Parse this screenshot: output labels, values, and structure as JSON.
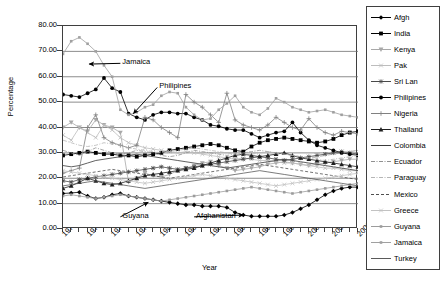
{
  "chart_data": {
    "type": "line",
    "title": "",
    "xlabel": "Year",
    "ylabel": "Percentage",
    "grid": "horizontal",
    "legend_position": "right",
    "xlim": [
      1970,
      2006
    ],
    "ylim": [
      0,
      80
    ],
    "ytick_step": 10,
    "ytick_labels": [
      "0.00",
      "10.00",
      "20.00",
      "30.00",
      "40.00",
      "50.00",
      "60.00",
      "70.00",
      "80.00"
    ],
    "ytick_values": [
      0,
      10,
      20,
      30,
      40,
      50,
      60,
      70,
      80
    ],
    "xtick_labels": [
      "1970",
      "1973",
      "1976",
      "1979",
      "1982",
      "1985",
      "1988",
      "1991",
      "1994",
      "1997",
      "2000",
      "2003",
      "2006"
    ],
    "xtick_values": [
      1970,
      1973,
      1976,
      1979,
      1982,
      1985,
      1988,
      1991,
      1994,
      1997,
      2000,
      2003,
      2006
    ],
    "x": [
      1970,
      1971,
      1972,
      1973,
      1974,
      1975,
      1976,
      1977,
      1978,
      1979,
      1980,
      1981,
      1982,
      1983,
      1984,
      1985,
      1986,
      1987,
      1988,
      1989,
      1990,
      1991,
      1992,
      1993,
      1994,
      1995,
      1996,
      1997,
      1998,
      1999,
      2000,
      2001,
      2002,
      2003,
      2004,
      2005,
      2006
    ],
    "annotations": [
      {
        "text": "Jamaica",
        "x": 1977.0,
        "y": 64.5,
        "arrow_to_x": 1973.2,
        "arrow_to_y": 65.0
      },
      {
        "text": "Philipines",
        "x": 1981.5,
        "y": 55.0,
        "arrow_to_x": 1978.6,
        "arrow_to_y": 45.5
      },
      {
        "text": "Guyana",
        "x": 1977.0,
        "y": 4.0,
        "arrow_to_x": 1980.4,
        "arrow_to_y": 10.5
      },
      {
        "text": "Afghanistan",
        "x": 1986.0,
        "y": 4.0,
        "arrow_to_x": 1992.0,
        "arrow_to_y": 5.5
      }
    ],
    "series": [
      {
        "name": "Afgh",
        "color": "#000000",
        "marker": "diamond",
        "dash": "none",
        "values": [
          14.0,
          14.2,
          14.5,
          13.0,
          12.0,
          12.5,
          13.5,
          14.0,
          13.0,
          12.5,
          12.0,
          11.5,
          11.0,
          10.5,
          10.0,
          9.5,
          9.5,
          9.0,
          9.0,
          9.0,
          8.5,
          6.5,
          5.5,
          5.0,
          5.0,
          5.0,
          5.0,
          5.5,
          6.5,
          8.0,
          9.5,
          11.5,
          13.5,
          15.0,
          16.0,
          16.5,
          16.5
        ]
      },
      {
        "name": "India",
        "color": "#000000",
        "marker": "square",
        "dash": "none",
        "values": [
          29.0,
          29.5,
          30.0,
          30.5,
          30.0,
          29.5,
          29.5,
          29.0,
          29.0,
          28.5,
          29.0,
          29.5,
          30.0,
          31.0,
          31.5,
          32.0,
          32.5,
          33.0,
          33.5,
          33.0,
          32.0,
          31.0,
          30.5,
          32.5,
          34.0,
          35.0,
          35.5,
          36.0,
          35.5,
          35.0,
          34.5,
          34.0,
          34.5,
          35.5,
          37.0,
          38.0,
          38.5
        ]
      },
      {
        "name": "Kenya",
        "color": "#a8a8a8",
        "marker": "tri-down",
        "dash": "none",
        "values": [
          40.0,
          42.0,
          40.0,
          38.5,
          43.0,
          41.0,
          40.0,
          38.0,
          18.5,
          20.0,
          22.0,
          21.0,
          20.5,
          21.5,
          23.0,
          24.0,
          25.0,
          26.0,
          26.5,
          25.0,
          24.0,
          23.0,
          23.5,
          24.0,
          24.5,
          25.5,
          26.0,
          26.5,
          26.0,
          25.5,
          25.0,
          25.5,
          26.0,
          26.5,
          27.0,
          27.5,
          27.5
        ]
      },
      {
        "name": "Pak",
        "color": "#bdbdbd",
        "marker": "x",
        "dash": "none",
        "values": [
          37.0,
          35.0,
          40.0,
          38.0,
          36.0,
          41.0,
          39.0,
          36.0,
          34.0,
          33.0,
          32.0,
          31.5,
          31.0,
          30.5,
          30.0,
          30.5,
          30.0,
          29.5,
          29.0,
          28.5,
          28.0,
          27.5,
          28.0,
          27.5,
          27.0,
          27.0,
          26.5,
          26.0,
          26.0,
          25.5,
          25.0,
          24.5,
          24.0,
          24.0,
          23.5,
          23.0,
          23.0
        ]
      },
      {
        "name": "Sri Lan",
        "color": "#4a4a4a",
        "marker": "star",
        "dash": "none",
        "values": [
          19.0,
          18.5,
          19.5,
          20.0,
          20.5,
          21.0,
          21.5,
          22.0,
          22.5,
          23.0,
          23.5,
          24.0,
          24.5,
          24.0,
          23.5,
          24.0,
          24.5,
          25.0,
          25.5,
          26.0,
          26.5,
          27.0,
          27.5,
          28.0,
          28.5,
          28.0,
          27.5,
          27.0,
          27.5,
          28.0,
          28.5,
          29.0,
          29.5,
          30.0,
          30.5,
          30.0,
          29.5
        ]
      },
      {
        "name": "Philipines",
        "color": "#000000",
        "marker": "circle",
        "dash": "none",
        "values": [
          53.0,
          52.5,
          52.0,
          53.5,
          55.0,
          59.5,
          55.5,
          54.0,
          45.5,
          44.0,
          43.0,
          45.0,
          46.0,
          46.0,
          45.5,
          45.5,
          44.0,
          43.0,
          41.0,
          40.5,
          39.5,
          39.0,
          39.0,
          37.5,
          36.0,
          37.0,
          38.0,
          38.5,
          42.0,
          38.0,
          35.0,
          33.0,
          32.0,
          31.0,
          30.0,
          29.5,
          29.0
        ]
      },
      {
        "name": "Nigeria",
        "color": "#808080",
        "marker": "plus",
        "dash": "none",
        "values": [
          22.0,
          23.0,
          24.0,
          40.0,
          45.0,
          36.0,
          34.0,
          33.0,
          32.0,
          33.0,
          44.0,
          43.0,
          40.0,
          38.0,
          36.0,
          53.0,
          50.0,
          48.0,
          45.0,
          42.0,
          53.5,
          43.0,
          41.0,
          40.0,
          39.0,
          41.0,
          44.0,
          42.0,
          40.0,
          39.0,
          43.5,
          40.0,
          38.0,
          37.0,
          38.5,
          38.0,
          37.5
        ]
      },
      {
        "name": "Thailand",
        "color": "#1f1f1f",
        "marker": "tri-up",
        "dash": "none",
        "values": [
          16.0,
          17.0,
          18.5,
          20.0,
          19.0,
          18.0,
          17.5,
          18.0,
          19.0,
          20.0,
          21.0,
          21.5,
          22.0,
          22.5,
          23.0,
          23.5,
          24.0,
          25.0,
          26.0,
          27.0,
          28.0,
          29.0,
          29.5,
          29.0,
          28.5,
          29.0,
          29.5,
          30.0,
          29.0,
          28.0,
          27.5,
          27.0,
          26.5,
          26.0,
          25.5,
          25.0,
          24.5
        ]
      },
      {
        "name": "Colombia",
        "color": "#3a3a3a",
        "marker": "none",
        "dash": "none",
        "values": [
          25.0,
          24.5,
          25.0,
          26.0,
          27.0,
          27.5,
          28.0,
          28.5,
          29.0,
          29.5,
          29.0,
          28.5,
          28.0,
          27.5,
          27.0,
          26.5,
          26.0,
          25.5,
          25.0,
          24.5,
          24.0,
          24.5,
          25.0,
          25.5,
          26.0,
          26.5,
          27.0,
          27.5,
          27.0,
          26.5,
          26.0,
          25.5,
          25.0,
          24.5,
          24.0,
          23.5,
          23.0
        ]
      },
      {
        "name": "Ecuador",
        "color": "#909090",
        "marker": "none",
        "dash": "dashdot",
        "values": [
          31.0,
          30.0,
          29.0,
          30.5,
          32.0,
          31.0,
          30.0,
          29.5,
          30.0,
          31.0,
          30.5,
          30.0,
          29.0,
          28.5,
          29.0,
          30.0,
          31.0,
          30.5,
          30.0,
          29.5,
          29.0,
          29.5,
          30.0,
          30.5,
          31.0,
          30.5,
          30.0,
          29.5,
          29.0,
          28.5,
          28.0,
          28.5,
          29.0,
          29.5,
          30.0,
          30.5,
          31.0
        ]
      },
      {
        "name": "Paraguay",
        "color": "#b5b5b5",
        "marker": "none",
        "dash": "dashdot",
        "values": [
          35.0,
          34.0,
          33.0,
          32.5,
          33.0,
          34.0,
          33.5,
          33.0,
          32.0,
          31.5,
          31.0,
          30.5,
          30.0,
          30.5,
          31.0,
          31.5,
          32.0,
          31.5,
          31.0,
          30.5,
          30.0,
          29.5,
          29.0,
          29.5,
          30.0,
          30.5,
          30.0,
          29.5,
          29.0,
          28.5,
          28.0,
          27.5,
          27.0,
          27.5,
          28.0,
          28.5,
          29.0
        ]
      },
      {
        "name": "Mexico",
        "color": "#4f4f4f",
        "marker": "none",
        "dash": "dashed",
        "values": [
          20.5,
          21.0,
          21.5,
          22.0,
          22.5,
          23.0,
          23.5,
          23.0,
          22.5,
          22.0,
          21.5,
          21.0,
          20.5,
          20.0,
          20.5,
          21.0,
          21.5,
          22.0,
          22.5,
          23.0,
          23.5,
          24.0,
          24.5,
          25.0,
          25.5,
          25.0,
          24.5,
          24.0,
          23.5,
          23.0,
          22.5,
          22.0,
          21.5,
          21.0,
          20.5,
          20.0,
          19.5
        ]
      },
      {
        "name": "Greece",
        "color": "#c2c2c2",
        "marker": "x",
        "dash": "none",
        "values": [
          23.0,
          22.5,
          22.0,
          21.5,
          21.0,
          20.5,
          20.0,
          19.5,
          19.0,
          18.5,
          18.0,
          18.5,
          19.0,
          19.5,
          20.0,
          20.5,
          21.0,
          21.5,
          21.0,
          20.5,
          20.0,
          19.5,
          19.0,
          18.5,
          18.0,
          17.5,
          17.0,
          17.5,
          18.0,
          18.5,
          19.0,
          19.5,
          20.0,
          20.5,
          21.0,
          21.5,
          22.0
        ]
      },
      {
        "name": "Guyana",
        "color": "#9c9c9c",
        "marker": "dot",
        "dash": "none",
        "values": [
          13.0,
          13.5,
          13.0,
          12.5,
          12.0,
          12.5,
          13.0,
          13.5,
          13.0,
          12.5,
          12.0,
          11.5,
          11.0,
          11.5,
          12.0,
          12.5,
          13.0,
          13.5,
          14.0,
          14.5,
          15.0,
          15.5,
          16.0,
          16.5,
          16.0,
          15.5,
          15.0,
          14.5,
          14.0,
          14.5,
          15.0,
          15.5,
          16.0,
          16.5,
          17.0,
          17.5,
          18.0
        ]
      },
      {
        "name": "Jamaica",
        "color": "#a0a0a0",
        "marker": "dot",
        "dash": "none",
        "values": [
          69.0,
          74.0,
          75.5,
          73.0,
          70.0,
          64.5,
          60.0,
          47.0,
          45.0,
          46.0,
          48.0,
          49.0,
          52.5,
          54.0,
          53.5,
          48.0,
          45.0,
          43.0,
          43.5,
          47.0,
          49.5,
          52.5,
          48.0,
          46.0,
          45.0,
          47.5,
          51.5,
          50.0,
          48.0,
          47.0,
          46.0,
          46.5,
          47.0,
          46.0,
          45.0,
          44.5,
          44.0
        ]
      },
      {
        "name": "Turkey",
        "color": "#5a5a5a",
        "marker": "none",
        "dash": "none",
        "values": [
          17.0,
          17.5,
          18.0,
          18.5,
          19.0,
          18.5,
          18.0,
          17.5,
          17.0,
          16.5,
          16.0,
          16.5,
          17.0,
          17.5,
          18.0,
          18.5,
          19.0,
          19.5,
          20.0,
          20.5,
          21.0,
          21.5,
          22.0,
          22.5,
          23.0,
          22.5,
          22.0,
          21.5,
          21.0,
          20.5,
          20.0,
          19.5,
          19.0,
          18.5,
          18.0,
          17.5,
          17.0
        ]
      }
    ]
  }
}
